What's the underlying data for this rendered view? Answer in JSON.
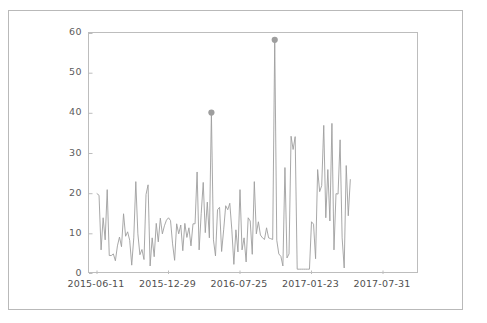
{
  "figure": {
    "title": "",
    "background_color": "#ffffff",
    "border_color": "#b9b9b9",
    "axes_border_color": "#bdbdbd"
  },
  "axis": {
    "y_label": "",
    "x_label": "",
    "y_ticks": [
      "60",
      "50",
      "40",
      "30",
      "20",
      "10",
      "0"
    ],
    "x_ticks": [
      "2015-06-11",
      "2015-12-29",
      "2016-07-25",
      "2017-01-23",
      "2017-07-31"
    ]
  },
  "chart_data": {
    "type": "line",
    "title": "",
    "xlabel": "",
    "ylabel": "",
    "ylim": [
      0,
      60
    ],
    "grid": false,
    "legend": "none",
    "line_color": "#9e9e9e",
    "marker_color": "#9e9e9e",
    "x_tick_labels": [
      "2015-06-11",
      "2015-12-29",
      "2016-07-25",
      "2017-01-23",
      "2017-07-31"
    ],
    "x_tick_positions": [
      0,
      35,
      70,
      105,
      140
    ],
    "y_tick_values": [
      0,
      10,
      20,
      30,
      40,
      50,
      60
    ],
    "series": [
      {
        "name": "value",
        "values": [
          20.0,
          19.6,
          6.0,
          14.0,
          8.5,
          21.0,
          4.6,
          4.6,
          5.0,
          3.3,
          7.0,
          9.2,
          6.8,
          15.0,
          9.4,
          10.5,
          8.4,
          2.2,
          9.0,
          23.0,
          10.0,
          4.8,
          6.1,
          3.6,
          19.8,
          22.2,
          2.0,
          9.0,
          4.3,
          12.6,
          8.0,
          13.9,
          10.0,
          12.0,
          13.4,
          14.0,
          13.3,
          7.5,
          3.4,
          12.5,
          10.0,
          12.2,
          5.8,
          12.6,
          9.1,
          11.5,
          7.0,
          12.5,
          12.5,
          25.4,
          6.0,
          15.0,
          22.8,
          10.3,
          17.9,
          9.0,
          40.2,
          8.5,
          4.5,
          16.0,
          16.6,
          5.6,
          11.0,
          17.0,
          16.0,
          17.6,
          11.0,
          2.4,
          11.0,
          5.5,
          21.0,
          6.0,
          9.0,
          3.0,
          14.0,
          13.2,
          4.9,
          23.0,
          10.0,
          13.0,
          9.7,
          9.0,
          8.6,
          11.5,
          9.0,
          8.8,
          8.6,
          58.3,
          8.4,
          5.0,
          4.4,
          2.0,
          26.5,
          4.0,
          5.0,
          34.3,
          31.0,
          34.2,
          1.2,
          1.2,
          1.2,
          1.2,
          1.2,
          1.2,
          1.2,
          13.0,
          12.4,
          3.8,
          26.0,
          20.5,
          22.0,
          37.0,
          14.0,
          26.0,
          13.2,
          37.5,
          6.0,
          20.0,
          19.9,
          33.4,
          9.0,
          1.5,
          27.0,
          14.5,
          23.5
        ],
        "markers": [
          {
            "index": 56,
            "value": 40.2
          },
          {
            "index": 87,
            "value": 58.3
          }
        ]
      }
    ]
  }
}
